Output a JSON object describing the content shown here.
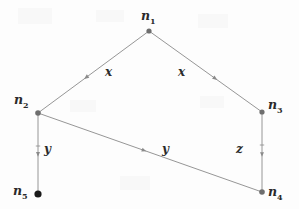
{
  "figure": {
    "background_color": "#fdfdfd",
    "edge_color": "#8a8a8a",
    "node_color": "#6e6e6e",
    "terminal_node_color": "#1a1a1a",
    "label_color": "#2b2b2b",
    "width": 299,
    "height": 209
  },
  "nodes": [
    {
      "id": "n1",
      "label": "n",
      "subscript": "1",
      "x": 149,
      "y": 31,
      "radius": 2.6,
      "label_x": 141,
      "label_y": 10,
      "filled": false
    },
    {
      "id": "n2",
      "label": "n",
      "subscript": "2",
      "x": 38,
      "y": 113,
      "radius": 2.8,
      "label_x": 14,
      "label_y": 94,
      "filled": false
    },
    {
      "id": "n3",
      "label": "n",
      "subscript": "3",
      "x": 262,
      "y": 112,
      "radius": 2.6,
      "label_x": 268,
      "label_y": 99,
      "filled": false
    },
    {
      "id": "n4",
      "label": "n",
      "subscript": "4",
      "x": 262,
      "y": 192,
      "radius": 2.8,
      "label_x": 268,
      "label_y": 186,
      "filled": false
    },
    {
      "id": "n5",
      "label": "n",
      "subscript": "5",
      "x": 38,
      "y": 194,
      "radius": 3.6,
      "label_x": 13,
      "label_y": 185,
      "filled": true
    }
  ],
  "edges": [
    {
      "id": "e-n1-n2",
      "from": "n1",
      "to": "n2",
      "label": "x",
      "label_x": 105,
      "label_y": 66,
      "arrow_t": 0.56,
      "arrow_size": 3.4
    },
    {
      "id": "e-n1-n3",
      "from": "n1",
      "to": "n3",
      "label": "x",
      "label_x": 178,
      "label_y": 66,
      "arrow_t": 0.58,
      "arrow_size": 3.4
    },
    {
      "id": "e-n2-n5",
      "from": "n2",
      "to": "n5",
      "label": "y",
      "label_x": 44,
      "label_y": 143,
      "arrow_t": 0.5,
      "arrow_size": 3.2
    },
    {
      "id": "e-n2-n4",
      "from": "n2",
      "to": "n4",
      "label": "y",
      "label_x": 162,
      "label_y": 143,
      "arrow_t": 0.47,
      "arrow_size": 3.2
    },
    {
      "id": "e-n3-n4",
      "from": "n3",
      "to": "n4",
      "label": "z",
      "label_x": 236,
      "label_y": 143,
      "arrow_t": 0.52,
      "arrow_size": 3.2
    }
  ],
  "arrow_marks": [
    {
      "id": "tick-n2-n5",
      "x": 38,
      "y": 146
    },
    {
      "id": "tick-n3-n4",
      "x": 262,
      "y": 145
    }
  ]
}
